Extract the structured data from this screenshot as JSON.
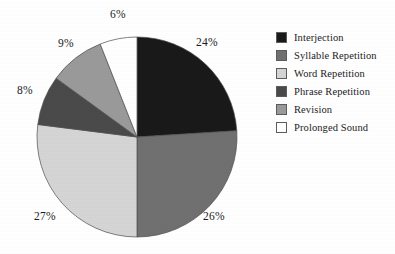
{
  "chart_data": {
    "type": "pie",
    "title": "",
    "legend_position": "right",
    "grid": false,
    "categories": [
      "Interjection",
      "Syllable Repetition",
      "Word Repetition",
      "Phrase Repetition",
      "Revision",
      "Prolonged Sound"
    ],
    "values": [
      24,
      26,
      27,
      8,
      9,
      6
    ],
    "value_labels": [
      "24%",
      "26%",
      "27%",
      "8%",
      "9%",
      "6%"
    ],
    "colors": [
      "#191919",
      "#707070",
      "#d5d5d5",
      "#4a4a4a",
      "#9a9a9a",
      "#ffffff"
    ],
    "slices": [
      {
        "label": "Interjection",
        "value": 24,
        "value_label": "24%",
        "color": "#191919",
        "start_angle": 0,
        "end_angle": 86.4,
        "label_x": 196,
        "label_y": 36
      },
      {
        "label": "Syllable Repetition",
        "value": 26,
        "value_label": "26%",
        "color": "#707070",
        "start_angle": 86.4,
        "end_angle": 180.0,
        "label_x": 203,
        "label_y": 210
      },
      {
        "label": "Word Repetition",
        "value": 27,
        "value_label": "27%",
        "color": "#d5d5d5",
        "start_angle": 180.0,
        "end_angle": 277.2,
        "label_x": 34,
        "label_y": 210
      },
      {
        "label": "Phrase Repetition",
        "value": 8,
        "value_label": "8%",
        "color": "#4a4a4a",
        "start_angle": 277.2,
        "end_angle": 306.0,
        "label_x": 17,
        "label_y": 84
      },
      {
        "label": "Revision",
        "value": 9,
        "value_label": "9%",
        "color": "#9a9a9a",
        "start_angle": 306.0,
        "end_angle": 338.4,
        "label_x": 58,
        "label_y": 37
      },
      {
        "label": "Prolonged Sound",
        "value": 6,
        "value_label": "6%",
        "color": "#ffffff",
        "start_angle": 338.4,
        "end_angle": 360.0,
        "label_x": 110,
        "label_y": 8
      }
    ],
    "geometry": {
      "center_x": 137,
      "center_y": 137,
      "radius": 100
    }
  },
  "legend": {
    "items": [
      {
        "label": "Interjection",
        "color": "#191919"
      },
      {
        "label": "Syllable Repetition",
        "color": "#707070"
      },
      {
        "label": "Word Repetition",
        "color": "#d5d5d5"
      },
      {
        "label": "Phrase Repetition",
        "color": "#4a4a4a"
      },
      {
        "label": "Revision",
        "color": "#9a9a9a"
      },
      {
        "label": "Prolonged Sound",
        "color": "#ffffff"
      }
    ]
  }
}
